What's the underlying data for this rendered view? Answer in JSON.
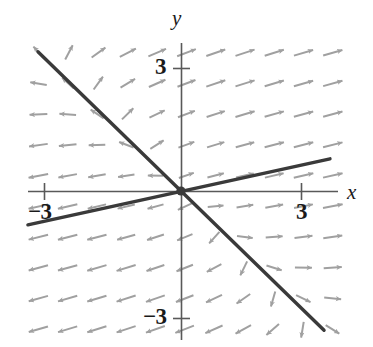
{
  "figure": {
    "kind": "direction-field",
    "title": "",
    "background": "#ffffff",
    "arrow_color": "#a0a0a0",
    "axis_color": "#595959",
    "line_color": "#3a3a3a",
    "text_color": "#1a1a1a"
  },
  "axes": {
    "x_label": "x",
    "y_label": "y",
    "x_tick_negative": "−3",
    "x_tick_positive": "3",
    "y_tick_positive": "3",
    "y_tick_negative": "−3",
    "origin_px": [
      181,
      191
    ],
    "unit_px_x": 45.7,
    "unit_px_y": 41.8,
    "x_axis_span_px": [
      28,
      338
    ],
    "y_axis_span_px": [
      43,
      340
    ],
    "x_ticks": [
      -3,
      3
    ],
    "y_ticks": [
      -3,
      3
    ]
  },
  "chart_data": {
    "type": "scatter",
    "title": "",
    "xlabel": "x",
    "ylabel": "y",
    "xlim": [
      -3.35,
      3.43
    ],
    "ylim": [
      -3.56,
      3.54
    ],
    "grid": false,
    "legend": null,
    "xticks": [
      -3,
      3
    ],
    "yticks": [
      -3,
      3
    ],
    "xticklabels": [
      "−3",
      "3"
    ],
    "yticklabels": [
      "−3",
      "3"
    ],
    "lines": [
      {
        "name": "eigenvector-line-descending",
        "start": [
          -3.13,
          3.33
        ],
        "end": [
          3.13,
          -3.33
        ],
        "slope": -1.06,
        "intercept": 0,
        "color": "#3a3a3a",
        "width_px": 3.4
      },
      {
        "name": "eigenvector-line-ascending",
        "start": [
          -3.35,
          -0.81
        ],
        "end": [
          3.26,
          0.77
        ],
        "slope": 0.238,
        "intercept": 0,
        "color": "#3a3a3a",
        "width_px": 3.4
      }
    ],
    "vector_field": {
      "description": "slope field arrows of a planar linear system; trajectories flow outward along the shallow positive-slope line and inward along the steep negative-slope line",
      "arrow_color": "#a0a0a0",
      "grid_cols": 11,
      "grid_rows": 10,
      "x_range": [
        -3.1,
        3.3
      ],
      "y_range": [
        -3.3,
        3.3
      ],
      "system": {
        "dx": "x + 0.22*y",
        "dy": "0.22*x + y",
        "note": "saddle-like outward flow"
      }
    }
  }
}
